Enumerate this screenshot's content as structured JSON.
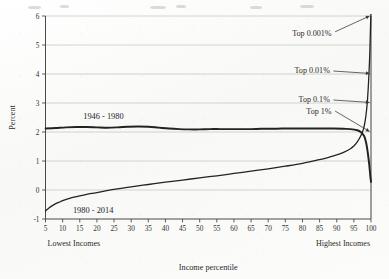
{
  "chart_data": {
    "type": "line",
    "title": "",
    "xlabel": "Income percentile",
    "ylabel": "Percent",
    "xlim": [
      5,
      100
    ],
    "ylim": [
      -1,
      6
    ],
    "grid": true,
    "legend_position": "inline-labels",
    "x_ticks": [
      5,
      10,
      15,
      20,
      25,
      30,
      35,
      40,
      45,
      50,
      55,
      60,
      65,
      70,
      75,
      80,
      85,
      90,
      95,
      100
    ],
    "x_tick_labels": [
      "5",
      "10",
      "15",
      "20",
      "25",
      "30",
      "35",
      "40",
      "45",
      "50",
      "55",
      "60",
      "65",
      "70",
      "75",
      "80",
      "85",
      "90",
      "95",
      "100"
    ],
    "y_ticks": [
      -1,
      0,
      1,
      2,
      3,
      4,
      5,
      6
    ],
    "y_tick_labels": [
      "-1",
      "0",
      "1",
      "2",
      "3",
      "4",
      "5",
      "6"
    ],
    "x_axis_end_labels": {
      "left": "Lowest Incomes",
      "right": "Highest Incomes"
    },
    "series": [
      {
        "name": "1946 - 1980",
        "label": "1946 - 1980",
        "label_x": 16,
        "label_y": 2.45,
        "color": "#23231f",
        "x": [
          5,
          8,
          11,
          14,
          17,
          20,
          23,
          26,
          29,
          32,
          35,
          38,
          41,
          44,
          47,
          50,
          53,
          56,
          59,
          62,
          65,
          68,
          71,
          74,
          77,
          80,
          83,
          86,
          89,
          92,
          94,
          96,
          97,
          98,
          98.6,
          99.1,
          99.5,
          99.8,
          100
        ],
        "y": [
          2.12,
          2.14,
          2.16,
          2.17,
          2.17,
          2.16,
          2.15,
          2.16,
          2.18,
          2.19,
          2.18,
          2.15,
          2.12,
          2.1,
          2.09,
          2.09,
          2.1,
          2.1,
          2.1,
          2.1,
          2.1,
          2.11,
          2.11,
          2.12,
          2.12,
          2.12,
          2.12,
          2.12,
          2.12,
          2.11,
          2.1,
          2.06,
          2.0,
          1.86,
          1.62,
          1.25,
          0.86,
          0.48,
          0.28
        ]
      },
      {
        "name": "1980 - 2014",
        "label": "1980 - 2014",
        "label_x": 13,
        "label_y": -0.78,
        "color": "#23231f",
        "x": [
          5,
          6,
          7,
          8,
          9,
          10,
          12,
          14,
          17,
          20,
          25,
          30,
          35,
          40,
          45,
          50,
          55,
          60,
          65,
          70,
          75,
          80,
          85,
          88,
          90,
          92,
          94,
          95,
          96,
          97,
          97.8,
          98.3,
          98.7,
          99,
          99.3,
          99.6,
          99.8,
          99.9,
          100
        ],
        "y": [
          -0.72,
          -0.62,
          -0.54,
          -0.47,
          -0.42,
          -0.37,
          -0.29,
          -0.23,
          -0.15,
          -0.09,
          0.02,
          0.11,
          0.19,
          0.27,
          0.34,
          0.42,
          0.49,
          0.57,
          0.65,
          0.73,
          0.82,
          0.92,
          1.05,
          1.14,
          1.21,
          1.3,
          1.42,
          1.52,
          1.66,
          1.86,
          2.1,
          2.38,
          2.75,
          3.15,
          3.75,
          4.55,
          5.35,
          5.8,
          6.1
        ]
      }
    ],
    "annotations": [
      {
        "text": "Top 0.001%",
        "text_x": 88.5,
        "text_y": 5.3,
        "arrow_to_x": 100,
        "arrow_to_y": 6.0,
        "style": "diagonal-up"
      },
      {
        "text": "Top 0.01%",
        "text_x": 88.0,
        "text_y": 4.02,
        "arrow_to_x": 100,
        "arrow_to_y": 4.02,
        "style": "horizontal"
      },
      {
        "text": "Top 0.1%",
        "text_x": 88.0,
        "text_y": 3.02,
        "arrow_to_x": 100,
        "arrow_to_y": 3.02,
        "style": "horizontal"
      },
      {
        "text": "Top 1%",
        "text_x": 88.5,
        "text_y": 2.62,
        "arrow_to_x": 100,
        "arrow_to_y": 2.02,
        "style": "diagonal-down"
      }
    ]
  }
}
